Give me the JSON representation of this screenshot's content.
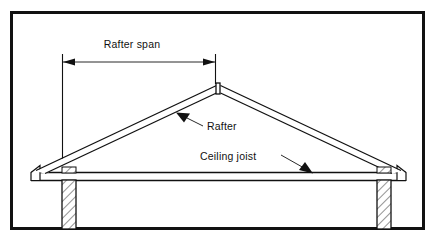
{
  "figure": {
    "name": "roof-framing-cross-section",
    "background_color": "#ffffff",
    "line_color": "#111111",
    "frame": {
      "name": "diagram-border",
      "x": 10,
      "y": 11,
      "width": 415,
      "height": 219,
      "stroke_width": 3
    }
  },
  "labels": {
    "rafter_span": "Rafter span",
    "rafter": "Rafter",
    "ceiling_joist": "Ceiling joist"
  },
  "dimension": {
    "name": "rafter-span-dimension",
    "label": "Rafter span",
    "arrow_y": 62,
    "left_x": 62,
    "right_x": 215,
    "left_extension_bottom": 161,
    "right_extension_bottom": 84,
    "label_x": 132,
    "label_y": 48
  },
  "callouts": [
    {
      "name": "rafter-callout",
      "label": "Rafter",
      "text_x": 206,
      "text_y": 128,
      "leader_from_x": 203,
      "leader_from_y": 125,
      "leader_to_x": 179,
      "leader_to_y": 114,
      "arrow_angle_deg": 205
    },
    {
      "name": "ceiling-joist-callout",
      "label": "Ceiling joist",
      "text_x": 200,
      "text_y": 160,
      "leader_from_x": 283,
      "leader_from_y": 155,
      "leader_to_x": 310,
      "leader_to_y": 172,
      "arrow_angle_deg": 32
    }
  ],
  "structure": {
    "ridge": {
      "name": "ridge-board",
      "x": 217,
      "y_top": 84,
      "y_bottom": 93,
      "width": 3
    },
    "rafters": {
      "name": "rafter-members",
      "apex_x": 218,
      "apex_y": 86,
      "left_eave_x": 38,
      "right_eave_x": 398,
      "eave_y": 172,
      "thickness": 7
    },
    "ceiling_joist": {
      "name": "ceiling-joist-member",
      "left_x": 31,
      "right_x": 406,
      "y_top": 172,
      "y_bottom": 180
    },
    "walls": [
      {
        "name": "left-wall",
        "x": 62,
        "width": 14,
        "y_top": 180,
        "y_bottom": 229,
        "hatched": true
      },
      {
        "name": "right-wall",
        "x": 377,
        "width": 14,
        "y_top": 180,
        "y_bottom": 229,
        "hatched": true
      }
    ]
  }
}
